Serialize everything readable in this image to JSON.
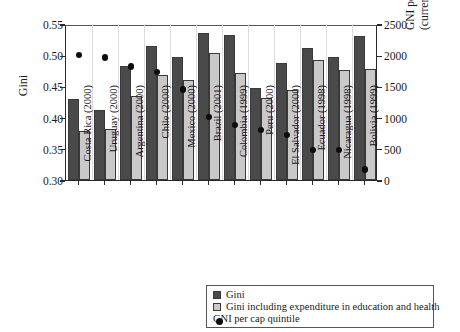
{
  "chart_data": {
    "type": "bar",
    "title": "",
    "xlabel": "",
    "ylabel": "Gini",
    "y2label_line1": "GNI per cap PPP",
    "y2label_line2": "(current international $)",
    "ylim": [
      0.3,
      0.55
    ],
    "y2lim": [
      0,
      2500
    ],
    "yticks": [
      "0.30",
      "0.35",
      "0.40",
      "0.45",
      "0.50",
      "0.55"
    ],
    "ytick_values": [
      0.3,
      0.35,
      0.4,
      0.45,
      0.5,
      0.55
    ],
    "y2ticks": [
      "0",
      "500",
      "1000",
      "1500",
      "2000",
      "2500"
    ],
    "y2tick_values": [
      0,
      500,
      1000,
      1500,
      2000,
      2500
    ],
    "grid": false,
    "legend_position": "bottom-right",
    "categories": [
      "Costa Rica (2000)",
      "Uruguay (2000)",
      "Argentina (2000)",
      "Chile (2000)",
      "Mexico (2000)",
      "Brazil (2001)",
      "Colombia (1999)",
      "Peru (2000)",
      "El Salvador (2000)",
      "Ecuador (1998)",
      "Nicaragua (1998)",
      "Bolivia (1999)"
    ],
    "series": [
      {
        "name": "Gini",
        "kind": "bar",
        "axis": "left",
        "color": "#4a4a4a",
        "values": [
          0.43,
          0.412,
          0.483,
          0.514,
          0.497,
          0.535,
          0.532,
          0.447,
          0.488,
          0.511,
          0.497,
          0.53
        ]
      },
      {
        "name": "Gini including expenditure in education and health",
        "kind": "bar",
        "axis": "left",
        "color": "#c9c9c9",
        "values": [
          0.378,
          0.381,
          0.434,
          0.468,
          0.461,
          0.503,
          0.472,
          0.432,
          0.445,
          0.492,
          0.477,
          0.478
        ]
      },
      {
        "name": "GNI per cap quintile",
        "kind": "scatter",
        "axis": "right",
        "color": "#0d0d0d",
        "values": [
          2000,
          1960,
          1820,
          1730,
          1450,
          1010,
          880,
          800,
          720,
          480,
          480,
          170
        ]
      }
    ]
  },
  "legend": {
    "items": [
      {
        "marker": "square-dark-icon",
        "label": "Gini"
      },
      {
        "marker": "square-light-icon",
        "label": "Gini including expenditure in education and health"
      },
      {
        "marker": "filled-circle-icon",
        "label": "GNI per cap quintile"
      }
    ]
  }
}
